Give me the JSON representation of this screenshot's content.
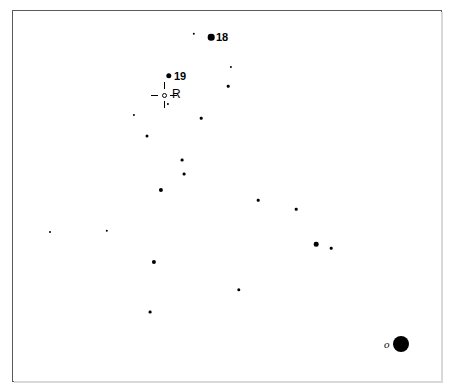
{
  "chart_data": {
    "type": "scatter",
    "title": "",
    "subtitle": "",
    "xlabel": "",
    "ylabel": "",
    "grid": false,
    "legend": "none",
    "field": {
      "x_min": 0,
      "x_max": 454,
      "y_min": 0,
      "y_max": 390,
      "frame_left": 12,
      "frame_top": 10,
      "frame_width": 430,
      "frame_height": 372,
      "background_color": "#ffffff",
      "ink_color": "#000000",
      "frame_color": "#5a5a5a"
    },
    "points": [
      {
        "id": "s01",
        "x": 194,
        "y": 34,
        "size": 2.4,
        "label": ""
      },
      {
        "id": "s02",
        "x": 211,
        "y": 37,
        "size": 6.6,
        "label": "18"
      },
      {
        "id": "s03",
        "x": 231,
        "y": 67,
        "size": 2.2,
        "label": ""
      },
      {
        "id": "s04",
        "x": 169,
        "y": 76,
        "size": 5.4,
        "label": "19"
      },
      {
        "id": "s05",
        "x": 228,
        "y": 86,
        "size": 2.6,
        "label": ""
      },
      {
        "id": "s06",
        "x": 168,
        "y": 104,
        "size": 2.2,
        "label": ""
      },
      {
        "id": "s07",
        "x": 134,
        "y": 115,
        "size": 2.2,
        "label": ""
      },
      {
        "id": "s08",
        "x": 201,
        "y": 118,
        "size": 2.6,
        "label": ""
      },
      {
        "id": "s09",
        "x": 147,
        "y": 136,
        "size": 3.0,
        "label": ""
      },
      {
        "id": "s10",
        "x": 182,
        "y": 160,
        "size": 2.8,
        "label": ""
      },
      {
        "id": "s11",
        "x": 184,
        "y": 174,
        "size": 2.8,
        "label": ""
      },
      {
        "id": "s12",
        "x": 161,
        "y": 190,
        "size": 4.2,
        "label": ""
      },
      {
        "id": "s13",
        "x": 258,
        "y": 200,
        "size": 2.6,
        "label": ""
      },
      {
        "id": "s14",
        "x": 296,
        "y": 209,
        "size": 2.6,
        "label": ""
      },
      {
        "id": "s15",
        "x": 50,
        "y": 232,
        "size": 2.0,
        "label": ""
      },
      {
        "id": "s16",
        "x": 107,
        "y": 231,
        "size": 2.4,
        "label": ""
      },
      {
        "id": "s17",
        "x": 316,
        "y": 244,
        "size": 4.6,
        "label": ""
      },
      {
        "id": "s18",
        "x": 331,
        "y": 248,
        "size": 2.6,
        "label": ""
      },
      {
        "id": "s19",
        "x": 154,
        "y": 262,
        "size": 4.2,
        "label": ""
      },
      {
        "id": "s20",
        "x": 239,
        "y": 290,
        "size": 3.4,
        "label": ""
      },
      {
        "id": "s21",
        "x": 150,
        "y": 312,
        "size": 2.8,
        "label": ""
      },
      {
        "id": "s22",
        "x": 401,
        "y": 344,
        "size": 16.0,
        "label": "o"
      }
    ],
    "labels": [
      {
        "id": "lab18",
        "text": "18",
        "x": 216,
        "y": 37,
        "style": "bold"
      },
      {
        "id": "lab19",
        "text": "19",
        "x": 174,
        "y": 76,
        "style": "bold"
      },
      {
        "id": "labR",
        "text": "R",
        "x": 172,
        "y": 94,
        "style": "plain"
      },
      {
        "id": "labo",
        "text": "o",
        "x": 384,
        "y": 344,
        "style": "italic-serif"
      }
    ],
    "markers": [
      {
        "id": "target-R",
        "kind": "crosshair-open-circle",
        "x": 164,
        "y": 95,
        "label": "R",
        "note": "open circle with four radial tick marks indicating the target object"
      }
    ]
  },
  "labels": {
    "star_18": "18",
    "star_19": "19",
    "target_r": "R",
    "star_o": "o"
  },
  "icons": {
    "target": "crosshair-icon"
  }
}
